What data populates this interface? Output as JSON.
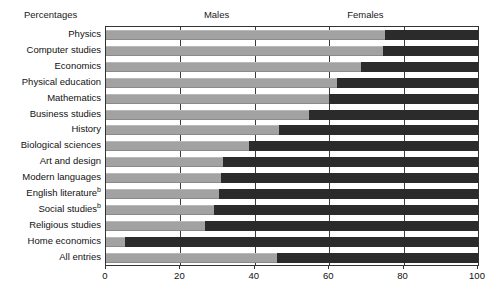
{
  "chart_data": {
    "type": "bar",
    "orientation": "horizontal",
    "stacked": true,
    "normalized": true,
    "title": "",
    "top_left_label": "Percentages",
    "xlabel": "",
    "ylabel": "",
    "xlim": [
      0,
      100
    ],
    "xticks": [
      0,
      20,
      40,
      60,
      80,
      100
    ],
    "xtick_labels": [
      "0",
      "20",
      "40",
      "60",
      "80",
      "100"
    ],
    "grid": "vertical",
    "legend_position": "top-inline",
    "legend": [
      "Males",
      "Females"
    ],
    "series": [
      {
        "name": "Males",
        "color": "#a2a2a2",
        "values": [
          75,
          74.5,
          68.5,
          62,
          60,
          54.5,
          46.5,
          38.5,
          31.5,
          31,
          30.5,
          29,
          26.5,
          5,
          46
        ]
      },
      {
        "name": "Females",
        "color": "#2b2b2b",
        "values": [
          25,
          25.5,
          31.5,
          38,
          40,
          45.5,
          53.5,
          61.5,
          68.5,
          69,
          69.5,
          71,
          73.5,
          95,
          54
        ]
      }
    ],
    "categories": [
      "Physics",
      "Computer studies",
      "Economics",
      "Physical education",
      "Mathematics",
      "Business studies",
      "History",
      "Biological sciences",
      "Art and design",
      "Modern languages",
      "English literature",
      "Social studies",
      "Religious studies",
      "Home economics",
      "All entries"
    ],
    "category_footnotes": [
      "",
      "",
      "",
      "",
      "",
      "",
      "",
      "",
      "",
      "",
      "b",
      "b",
      "",
      "",
      ""
    ]
  }
}
